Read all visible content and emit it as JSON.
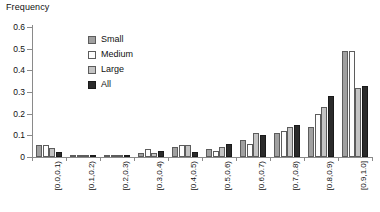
{
  "chart_data": {
    "type": "bar",
    "title": "",
    "ylabel": "Frequency",
    "xlabel": "",
    "ylim": [
      0,
      0.6
    ],
    "yticks": [
      "0",
      "0.1",
      "0.2",
      "0.3",
      "0.4",
      "0.5",
      "0.6"
    ],
    "ytick_values": [
      0,
      0.1,
      0.2,
      0.3,
      0.4,
      0.5,
      0.6
    ],
    "grid": false,
    "legend_position": "upper-left-inside",
    "categories": [
      "[0.0,0.1)",
      "[0.1,0.2)",
      "[0.2,0.3)",
      "[0.3,0.4)",
      "[0.4,0.5)",
      "[0.5,0.6)",
      "[0.6,0.7)",
      "[0.7,0.8)",
      "[0.8,0.9)",
      "[0.9,1.0]"
    ],
    "series": [
      {
        "name": "Small",
        "color": "#a0a0a0",
        "values": [
          0.055,
          0.005,
          0.005,
          0.02,
          0.045,
          0.035,
          0.08,
          0.11,
          0.14,
          0.49
        ]
      },
      {
        "name": "Medium",
        "color": "#fdfdfd",
        "values": [
          0.055,
          0.005,
          0.005,
          0.035,
          0.055,
          0.03,
          0.06,
          0.12,
          0.2,
          0.49
        ]
      },
      {
        "name": "Large",
        "color": "#c4c4c4",
        "values": [
          0.04,
          0.01,
          0.01,
          0.02,
          0.055,
          0.045,
          0.11,
          0.14,
          0.23,
          0.32
        ]
      },
      {
        "name": "All",
        "color": "#2b2b2b",
        "values": [
          0.025,
          0.01,
          0.01,
          0.03,
          0.025,
          0.06,
          0.1,
          0.15,
          0.28,
          0.33
        ]
      }
    ]
  }
}
